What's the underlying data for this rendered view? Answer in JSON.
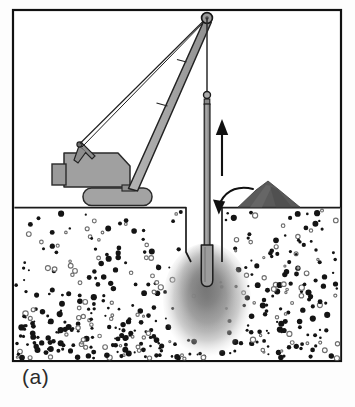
{
  "figure": {
    "caption": "(a)",
    "frame": {
      "x": 13,
      "y": 10,
      "width": 328,
      "height": 351,
      "stroke": "#111111",
      "stroke_width": 2.2
    },
    "colors": {
      "background": "#ffffff",
      "outline": "#1a1a1a",
      "machine_fill": "#9e9e9e",
      "machine_fill_dark": "#8a8a8a",
      "boom_fill": "#a6a6a6",
      "track_fill": "#a0a0a0",
      "soil_background": "#ffffff",
      "soil_grain_solid": "#141414",
      "soil_grain_ring": "#6f6f6f",
      "gravel_pile": "#5d5d5d",
      "compacted_zone": "#8c8c8c",
      "probe_fill": "#9a9a9a",
      "arrow": "#111111",
      "ground_line": "#1a1a1a"
    },
    "ground": {
      "surface_y": 207,
      "label": "ground-surface-line"
    },
    "crane": {
      "name": "crawler-crane",
      "boom": {
        "tip_x": 207,
        "tip_y": 18,
        "heel_x": 135,
        "heel_y": 192,
        "segments": 3
      },
      "cab": {
        "x": 64,
        "y": 152,
        "width": 66,
        "height": 34
      },
      "front_box": {
        "x": 52,
        "y": 163,
        "width": 15,
        "height": 19
      },
      "track": {
        "x": 83,
        "y": 188,
        "width": 68,
        "height": 17
      },
      "a_frame_apex_x": 78,
      "a_frame_apex_y": 144,
      "pendant_lines": 2
    },
    "probe": {
      "name": "vibroflot-probe",
      "shaft_x": 207,
      "shaft_top_y": 92,
      "shaft_width": 5,
      "tip_y": 285,
      "upper_pulley_y": 95,
      "follower_tube_top_y": 245,
      "follower_tube_width": 11
    },
    "hoist_cable": {
      "from_x": 207,
      "from_y": 18,
      "to_x": 207,
      "to_y": 92
    },
    "compacted_zone": {
      "center_x": 207,
      "center_y": 300,
      "radius_x": 42,
      "radius_y": 55
    },
    "gravel_pile": {
      "peak_x": 270,
      "peak_y": 182,
      "base_left_x": 240,
      "base_right_x": 302,
      "base_y": 207
    },
    "hole": {
      "left_x": 186,
      "right_x": 222,
      "collar_y": 207,
      "depth_y": 262
    },
    "arrows": [
      {
        "name": "lift-arrow-up",
        "type": "straight",
        "x": 222,
        "y_tail": 175,
        "y_head": 122,
        "direction": "up"
      },
      {
        "name": "backfill-arrow-curved",
        "type": "curved",
        "from_x": 252,
        "from_y": 189,
        "to_x": 216,
        "to_y": 214,
        "direction": "down-left"
      }
    ],
    "soil": {
      "name": "granular-soil-matrix",
      "description": "loose granular deposit densifying with depth",
      "grain_count": 430,
      "ring_ratio": 0.27,
      "top_y": 208,
      "bottom_y": 359,
      "left_x": 15,
      "right_x": 339
    }
  }
}
